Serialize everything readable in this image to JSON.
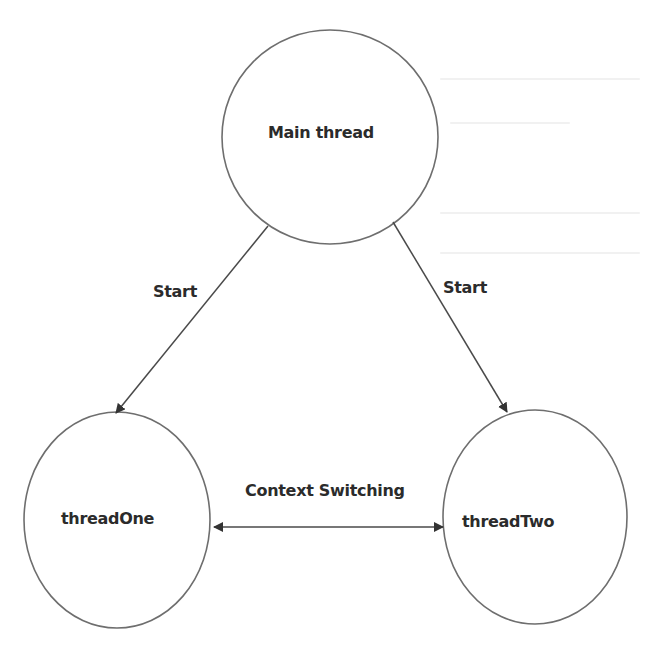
{
  "diagram": {
    "type": "thread-state-diagram",
    "colors": {
      "background": "#ffffff",
      "node_stroke": "#6e6e6e",
      "edge_stroke": "#4a4a4a",
      "text": "#2b2b2b"
    },
    "nodes": [
      {
        "id": "main",
        "label": "Main thread",
        "shape": "ellipse"
      },
      {
        "id": "one",
        "label": "threadOne",
        "shape": "ellipse"
      },
      {
        "id": "two",
        "label": "threadTwo",
        "shape": "ellipse"
      }
    ],
    "edges": [
      {
        "from": "main",
        "to": "one",
        "label": "Start",
        "direction": "forward"
      },
      {
        "from": "main",
        "to": "two",
        "label": "Start",
        "direction": "forward"
      },
      {
        "from": "one",
        "to": "two",
        "label": "Context Switching",
        "direction": "both"
      }
    ]
  }
}
